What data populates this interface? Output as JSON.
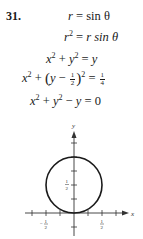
{
  "problem": {
    "number": "31.",
    "steps": [
      {
        "lhs": "r",
        "rhs": "sin θ"
      },
      {
        "lhs": "r",
        "lhs_exp": "2",
        "rhs": "r sin θ"
      },
      {
        "text_a": "x",
        "exp_a": "2",
        "op": "+",
        "text_b": "y",
        "exp_b": "2",
        "eq": "=",
        "rhs": "y"
      },
      {
        "text_a": "x",
        "exp_a": "2",
        "op": "+",
        "paren_left": "(",
        "var": "y",
        "minus": "−",
        "frac_num": "1",
        "frac_den": "2",
        "paren_right": ")",
        "exp_b": "2",
        "eq": "=",
        "rhs_num": "1",
        "rhs_den": "4"
      },
      {
        "text_a": "x",
        "exp_a": "2",
        "op": "+",
        "text_b": "y",
        "exp_b": "2",
        "op2": "−",
        "text_c": "y",
        "eq": "=",
        "rhs": "0"
      }
    ]
  },
  "graph": {
    "x_label": "x",
    "y_label": "y",
    "x_tick_labels": [
      {
        "num": "1",
        "den": "2",
        "sign": "−"
      },
      {
        "num": "1",
        "den": "2",
        "sign": ""
      }
    ],
    "y_tick_labels": [
      {
        "num": "1",
        "den": "2"
      }
    ],
    "circle": {
      "center": [
        0,
        0.5
      ],
      "radius": 0.5
    },
    "colors": {
      "curve": "#1a1a1a",
      "axis": "#333333"
    }
  }
}
